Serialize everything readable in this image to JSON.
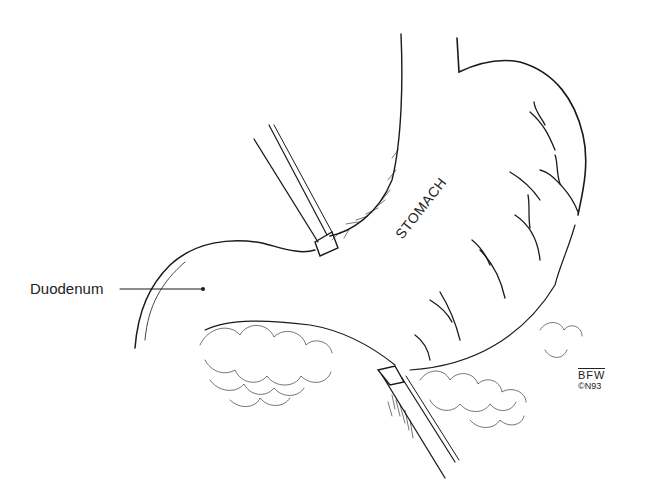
{
  "figure": {
    "type": "surgical-line-illustration",
    "labels": {
      "duodenum": "Duodenum",
      "stomach": "STOMACH"
    },
    "signature": {
      "initials": "BFW",
      "year": "©N93"
    },
    "colors": {
      "background": "#ffffff",
      "ink": "#1a1a1a"
    }
  }
}
